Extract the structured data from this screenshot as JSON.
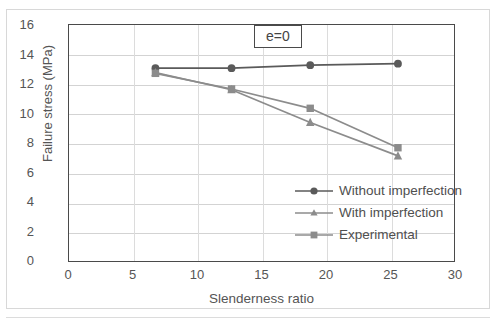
{
  "chart_data": {
    "type": "line",
    "title": "",
    "annotation": "e=0",
    "xlabel": "Slenderness ratio",
    "ylabel": "Failure stress (MPa)",
    "xlim": [
      0,
      30
    ],
    "ylim": [
      0,
      16
    ],
    "xticks": [
      0,
      5,
      10,
      15,
      20,
      25,
      30
    ],
    "yticks": [
      0,
      2,
      4,
      6,
      8,
      10,
      12,
      14,
      16
    ],
    "grid": true,
    "legend_position": "lower-right-inside",
    "x": [
      6.7,
      12.6,
      18.7,
      25.5
    ],
    "series": [
      {
        "name": "Without imperfection",
        "marker": "circle",
        "color": "#5a5a5a",
        "values": [
          13.1,
          13.1,
          13.3,
          13.4
        ]
      },
      {
        "name": "With imperfection",
        "marker": "triangle",
        "color": "#8c8c8c",
        "values": [
          12.8,
          11.65,
          9.45,
          7.2
        ]
      },
      {
        "name": "Experimental",
        "marker": "square",
        "color": "#8c8c8c",
        "values": [
          12.75,
          11.7,
          10.4,
          7.75
        ]
      }
    ]
  },
  "ticks": {
    "y": [
      "16",
      "14",
      "12",
      "10",
      "8",
      "6",
      "4",
      "2",
      "0"
    ],
    "x": [
      "0",
      "5",
      "10",
      "15",
      "20",
      "25",
      "30"
    ]
  },
  "axis": {
    "x_title": "Slenderness ratio",
    "y_title": "Failure stress (MPa)"
  },
  "annotation": {
    "text": "e=0"
  },
  "legend": {
    "items": [
      {
        "label": "Without imperfection"
      },
      {
        "label": "With imperfection"
      },
      {
        "label": "Experimental"
      }
    ]
  }
}
